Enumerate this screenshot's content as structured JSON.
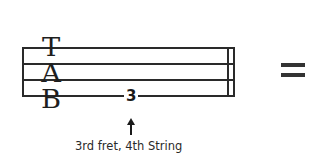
{
  "tab_diagram": {
    "clef_letters": [
      "T",
      "A",
      "B"
    ],
    "strings_visible": 4,
    "fret_number": "3",
    "caption": "3rd fret, 4th String",
    "equals_sign": "="
  },
  "colors": {
    "ink": "#2a2a2a",
    "background": "#ffffff"
  }
}
